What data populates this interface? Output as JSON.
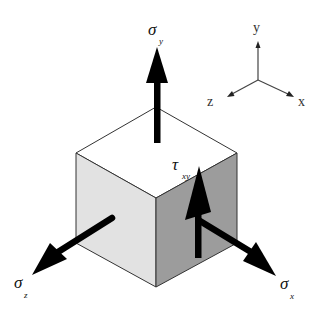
{
  "diagram": {
    "title": "",
    "type": "stress-element-3d",
    "colors": {
      "top_face": "#ffffff",
      "left_face": "#e2e2e2",
      "right_face": "#9c9c9c",
      "edge": "#333333",
      "arrow": "#000000",
      "axis": "#444444"
    },
    "axes": {
      "y_label": "y",
      "z_label": "z",
      "x_label": "x"
    },
    "stresses": {
      "sigma_y": {
        "symbol": "σ",
        "subscript": "y"
      },
      "sigma_z": {
        "symbol": "σ",
        "subscript": "z"
      },
      "sigma_x": {
        "symbol": "σ",
        "subscript": "x"
      },
      "tau_xy": {
        "symbol": "τ",
        "subscript": "xy"
      }
    }
  }
}
